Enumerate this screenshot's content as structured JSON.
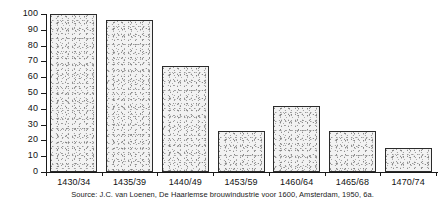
{
  "chart_data": {
    "type": "bar",
    "title": "",
    "xlabel": "",
    "ylabel": "",
    "categories": [
      "1430/34",
      "1435/39",
      "1440/49",
      "1453/59",
      "1460/64",
      "1465/68",
      "1470/74"
    ],
    "values": [
      100,
      96,
      67,
      26,
      42,
      26,
      15
    ],
    "ylim": [
      0,
      100
    ],
    "yticks": [
      0,
      10,
      20,
      30,
      40,
      50,
      60,
      70,
      80,
      90,
      100
    ],
    "ytick_labels": [
      "0",
      "10",
      "20",
      "30",
      "40",
      "50",
      "60",
      "70",
      "80",
      "90",
      "100"
    ],
    "grid": false,
    "legend": null,
    "bar_fill": "#f2f2f2",
    "bar_edge": "#2b2b2b",
    "axis_color": "#1a1a1a"
  },
  "source": {
    "note": "Source: J.C. van Loenen, De Haarlemse brouwindustrie voor 1600, Amsterdam, 1950, 6a."
  }
}
